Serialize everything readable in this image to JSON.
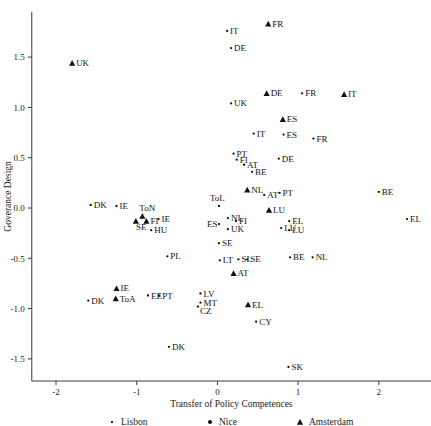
{
  "chart_data": {
    "type": "scatter",
    "title": "",
    "xlabel": "Transfer of Policy Competences",
    "ylabel": "Goverance Design",
    "xlim": [
      -2.3,
      2.65
    ],
    "ylim": [
      -1.72,
      1.95
    ],
    "xticks": [
      -2,
      -1,
      0,
      1,
      2
    ],
    "xtick_labels": [
      "-2",
      "-1",
      "0",
      "1",
      "2"
    ],
    "yticks": [
      -1.5,
      -1.0,
      -0.5,
      0.0,
      0.5,
      1.0,
      1.5
    ],
    "ytick_labels": [
      "-1.5",
      "-1.0",
      "-0.5",
      "0.0",
      "0.5",
      "1.0",
      "1.5"
    ],
    "grid": false,
    "legend_position": "bottom",
    "legend": [
      {
        "name": "Lisbon",
        "marker": "lisbon"
      },
      {
        "name": "Nice",
        "marker": "nice"
      },
      {
        "name": "Amsterdam",
        "marker": "amsterdam"
      }
    ],
    "series": [
      {
        "name": "Lisbon",
        "marker": "lisbon",
        "points": [
          {
            "label": "IT",
            "x": 0.12,
            "y": 1.76,
            "lx": 3,
            "ly": 3
          },
          {
            "label": "DE",
            "x": 0.17,
            "y": 1.59,
            "lx": 3,
            "ly": 3
          },
          {
            "label": "UK",
            "x": 0.17,
            "y": 1.04,
            "lx": 3,
            "ly": 3
          },
          {
            "label": "FR",
            "x": 1.05,
            "y": 1.14,
            "lx": 3,
            "ly": 3
          },
          {
            "label": "IT",
            "x": 0.45,
            "y": 0.74,
            "lx": 3,
            "ly": 3
          },
          {
            "label": "ES",
            "x": 0.82,
            "y": 0.73,
            "lx": 3,
            "ly": 3
          },
          {
            "label": "FR",
            "x": 1.19,
            "y": 0.69,
            "lx": 3,
            "ly": 3
          },
          {
            "label": "PT",
            "x": 0.2,
            "y": 0.54,
            "lx": 3,
            "ly": 3
          },
          {
            "label": "FI",
            "x": 0.24,
            "y": 0.48,
            "lx": 3,
            "ly": 3
          },
          {
            "label": "AT",
            "x": 0.33,
            "y": 0.43,
            "lx": 3,
            "ly": 3
          },
          {
            "label": "DE",
            "x": 0.76,
            "y": 0.49,
            "lx": 3,
            "ly": 3
          },
          {
            "label": "BE",
            "x": 0.43,
            "y": 0.36,
            "lx": 3,
            "ly": 3
          },
          {
            "label": "BE",
            "x": 2.0,
            "y": 0.16,
            "lx": 3,
            "ly": 3
          },
          {
            "label": "AT",
            "x": 0.58,
            "y": 0.13,
            "lx": 3,
            "ly": 3
          },
          {
            "label": "PT",
            "x": 0.77,
            "y": 0.15,
            "lx": 3,
            "ly": 3
          },
          {
            "label": "DK",
            "x": -1.57,
            "y": 0.03,
            "lx": 3,
            "ly": 3
          },
          {
            "label": "IE",
            "x": -1.25,
            "y": 0.02,
            "lx": 3,
            "ly": 3
          },
          {
            "label": "ToL",
            "x": 0.02,
            "y": 0.02,
            "lx": -9,
            "ly": -5
          },
          {
            "label": "EL",
            "x": 2.35,
            "y": -0.11,
            "lx": 3,
            "ly": 3
          },
          {
            "label": "IE",
            "x": -0.73,
            "y": -0.11,
            "lx": 3,
            "ly": 3
          },
          {
            "label": "ES",
            "x": 0.02,
            "y": -0.16,
            "lx": -12,
            "ly": 3
          },
          {
            "label": "NL",
            "x": 0.13,
            "y": -0.1,
            "lx": 3,
            "ly": 3
          },
          {
            "label": "FI",
            "x": 0.23,
            "y": -0.13,
            "lx": 3,
            "ly": 3
          },
          {
            "label": "EL",
            "x": 0.89,
            "y": -0.13,
            "lx": 3,
            "ly": 3
          },
          {
            "label": "LU",
            "x": 0.79,
            "y": -0.2,
            "lx": 3,
            "ly": 3
          },
          {
            "label": "LU",
            "x": 0.89,
            "y": -0.22,
            "lx": 3,
            "ly": 3
          },
          {
            "label": "UK",
            "x": 0.13,
            "y": -0.21,
            "lx": 3,
            "ly": 3
          },
          {
            "label": "HU",
            "x": -0.82,
            "y": -0.22,
            "lx": 3,
            "ly": 3
          },
          {
            "label": "SE",
            "x": 0.02,
            "y": -0.35,
            "lx": 3,
            "ly": 3
          },
          {
            "label": "PL",
            "x": -0.62,
            "y": -0.48,
            "lx": 3,
            "ly": 3
          },
          {
            "label": "LT",
            "x": 0.03,
            "y": -0.52,
            "lx": 3,
            "ly": 3
          },
          {
            "label": "SL",
            "x": 0.26,
            "y": -0.51,
            "lx": 3,
            "ly": 3
          },
          {
            "label": "SE",
            "x": 0.37,
            "y": -0.51,
            "lx": 3,
            "ly": 3
          },
          {
            "label": "BE",
            "x": 0.9,
            "y": -0.49,
            "lx": 3,
            "ly": 3
          },
          {
            "label": "NL",
            "x": 1.18,
            "y": -0.49,
            "lx": 3,
            "ly": 3
          },
          {
            "label": "DK",
            "x": -1.6,
            "y": -0.92,
            "lx": 3,
            "ly": 3
          },
          {
            "label": "EE",
            "x": -0.86,
            "y": -0.87,
            "lx": 3,
            "ly": 3
          },
          {
            "label": "PT",
            "x": -0.72,
            "y": -0.87,
            "lx": 3,
            "ly": 3
          },
          {
            "label": "LV",
            "x": -0.21,
            "y": -0.85,
            "lx": 3,
            "ly": 3
          },
          {
            "label": "MT",
            "x": -0.21,
            "y": -0.94,
            "lx": 3,
            "ly": 3
          },
          {
            "label": "CZ",
            "x": -0.24,
            "y": -0.98,
            "lx": 2,
            "ly": 7
          },
          {
            "label": "CY",
            "x": 0.48,
            "y": -1.13,
            "lx": 3,
            "ly": 3
          },
          {
            "label": "DK",
            "x": -0.6,
            "y": -1.38,
            "lx": 3,
            "ly": 3
          },
          {
            "label": "SK",
            "x": 0.88,
            "y": -1.58,
            "lx": 3,
            "ly": 3
          }
        ]
      },
      {
        "name": "Amsterdam",
        "marker": "amsterdam",
        "points": [
          {
            "label": "UK",
            "x": -1.8,
            "y": 1.44,
            "lx": 4,
            "ly": 3
          },
          {
            "label": "FR",
            "x": 0.63,
            "y": 1.83,
            "lx": 4,
            "ly": 3
          },
          {
            "label": "DE",
            "x": 0.61,
            "y": 1.14,
            "lx": 4,
            "ly": 3
          },
          {
            "label": "IT",
            "x": 1.57,
            "y": 1.13,
            "lx": 4,
            "ly": 3
          },
          {
            "label": "ES",
            "x": 0.81,
            "y": 0.88,
            "lx": 4,
            "ly": 3
          },
          {
            "label": "NL",
            "x": 0.37,
            "y": 0.18,
            "lx": 4,
            "ly": 3
          },
          {
            "label": "LU",
            "x": 0.64,
            "y": -0.02,
            "lx": 4,
            "ly": 3
          },
          {
            "label": "ToN",
            "x": -0.93,
            "y": -0.08,
            "lx": -3,
            "ly": -5
          },
          {
            "label": "FI",
            "x": -0.88,
            "y": -0.13,
            "lx": 4,
            "ly": 3
          },
          {
            "label": "SE",
            "x": -1.01,
            "y": -0.13,
            "lx": 0,
            "ly": 9
          },
          {
            "label": "AT",
            "x": 0.2,
            "y": -0.65,
            "lx": 4,
            "ly": 3
          },
          {
            "label": "EL",
            "x": 0.38,
            "y": -0.96,
            "lx": 4,
            "ly": 3
          },
          {
            "label": "IE",
            "x": -1.25,
            "y": -0.8,
            "lx": 4,
            "ly": 3
          },
          {
            "label": "ToA",
            "x": -1.26,
            "y": -0.9,
            "lx": 4,
            "ly": 3
          }
        ]
      }
    ]
  }
}
